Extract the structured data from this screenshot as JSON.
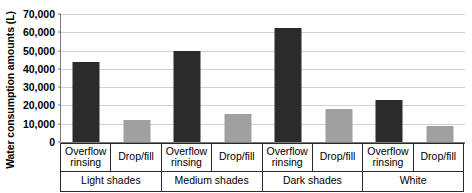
{
  "chart_data": {
    "type": "bar",
    "title": "",
    "xlabel": "",
    "ylabel": "Water consumption amounts (L)",
    "ylim": [
      0,
      70000
    ],
    "ytick_labels": [
      "70,000",
      "60,000",
      "50,000",
      "40,000",
      "30,000",
      "20,000",
      "10,000",
      "0"
    ],
    "ytick_values": [
      70000,
      60000,
      50000,
      40000,
      30000,
      20000,
      10000,
      0
    ],
    "grid": true,
    "legend": "none",
    "groups": [
      "Light shades",
      "Medium shades",
      "Dark shades",
      "White"
    ],
    "series_names": [
      "Overflow rinsing",
      "Drop/fill"
    ],
    "categories": [
      "Overflow rinsing",
      "Drop/fill",
      "Overflow rinsing",
      "Drop/fill",
      "Overflow rinsing",
      "Drop/fill",
      "Overflow rinsing",
      "Drop/fill"
    ],
    "values": [
      44000,
      12000,
      50000,
      15500,
      62500,
      18000,
      23000,
      8500
    ],
    "bars": [
      {
        "group": "Light shades",
        "series": "Overflow rinsing",
        "value": 44000,
        "color": "#2b2b2b"
      },
      {
        "group": "Light shades",
        "series": "Drop/fill",
        "value": 12000,
        "color": "#a0a0a0"
      },
      {
        "group": "Medium shades",
        "series": "Overflow rinsing",
        "value": 50000,
        "color": "#2b2b2b"
      },
      {
        "group": "Medium shades",
        "series": "Drop/fill",
        "value": 15500,
        "color": "#a0a0a0"
      },
      {
        "group": "Dark shades",
        "series": "Overflow rinsing",
        "value": 62500,
        "color": "#2b2b2b"
      },
      {
        "group": "Dark shades",
        "series": "Drop/fill",
        "value": 18000,
        "color": "#a0a0a0"
      },
      {
        "group": "White",
        "series": "Overflow rinsing",
        "value": 23000,
        "color": "#2b2b2b"
      },
      {
        "group": "White",
        "series": "Drop/fill",
        "value": 8500,
        "color": "#a0a0a0"
      }
    ],
    "colors": {
      "overflow_rinsing": "#2b2b2b",
      "drop_fill": "#a0a0a0",
      "gridline": "#d2d2d2",
      "axis": "#7a7a7a",
      "text": "#000000"
    }
  },
  "axis": {
    "y_title": "Water consumption amounts (L)",
    "ticks": [
      "70,000",
      "60,000",
      "50,000",
      "40,000",
      "30,000",
      "20,000",
      "10,000",
      "0"
    ]
  },
  "x_labels": {
    "series": [
      "Overflow rinsing",
      "Drop/fill",
      "Overflow rinsing",
      "Drop/fill",
      "Overflow rinsing",
      "Drop/fill",
      "Overflow rinsing",
      "Drop/fill"
    ],
    "groups": [
      "Light shades",
      "Medium shades",
      "Dark shades",
      "White"
    ]
  }
}
